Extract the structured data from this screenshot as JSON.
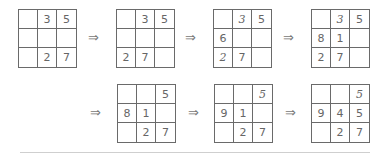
{
  "arrow_symbol": "⇒",
  "grids": [
    {
      "id": "g1",
      "cells": [
        [
          "",
          "3",
          "5"
        ],
        [
          "",
          "",
          ""
        ],
        [
          "",
          "2",
          "7"
        ]
      ],
      "italic": []
    },
    {
      "id": "g2",
      "cells": [
        [
          "",
          "3",
          "5"
        ],
        [
          "",
          "",
          ""
        ],
        [
          "2",
          "7",
          ""
        ]
      ],
      "italic": []
    },
    {
      "id": "g3",
      "cells": [
        [
          "",
          "3",
          "5"
        ],
        [
          "6",
          "",
          ""
        ],
        [
          "2",
          "7",
          ""
        ]
      ],
      "italic": [
        "0-1",
        "2-0"
      ]
    },
    {
      "id": "g4",
      "cells": [
        [
          "",
          "3",
          "5"
        ],
        [
          "8",
          "1",
          ""
        ],
        [
          "2",
          "7",
          ""
        ]
      ],
      "italic": [
        "0-1"
      ]
    },
    {
      "id": "g5",
      "cells": [
        [
          "",
          "",
          "5"
        ],
        [
          "8",
          "1",
          ""
        ],
        [
          "",
          "2",
          "7"
        ]
      ],
      "italic": []
    },
    {
      "id": "g6",
      "cells": [
        [
          "",
          "",
          "5"
        ],
        [
          "9",
          "1",
          ""
        ],
        [
          "",
          "2",
          "7"
        ]
      ],
      "italic": [
        "0-2"
      ]
    },
    {
      "id": "g7",
      "cells": [
        [
          "",
          "",
          "5"
        ],
        [
          "9",
          "4",
          "5"
        ],
        [
          "",
          "2",
          "7"
        ]
      ],
      "italic": [
        "0-2"
      ]
    }
  ],
  "layout": {
    "grids": [
      {
        "left": 18,
        "top": 9
      },
      {
        "left": 116,
        "top": 9
      },
      {
        "left": 213,
        "top": 9
      },
      {
        "left": 311,
        "top": 9
      },
      {
        "left": 117,
        "top": 84
      },
      {
        "left": 214,
        "top": 84
      },
      {
        "left": 311,
        "top": 84
      }
    ],
    "arrows": [
      {
        "left": 88,
        "top": 31
      },
      {
        "left": 185,
        "top": 31
      },
      {
        "left": 283,
        "top": 31
      },
      {
        "left": 90,
        "top": 106
      },
      {
        "left": 188,
        "top": 106
      },
      {
        "left": 285,
        "top": 106
      }
    ]
  }
}
